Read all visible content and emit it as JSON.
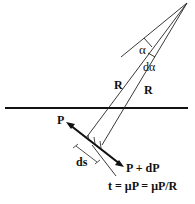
{
  "diagram": {
    "labels": {
      "alpha": "α",
      "d_alpha": "dα",
      "radius_left": "R",
      "radius_right": "R",
      "tension_in": "P",
      "tension_out": "P + dP",
      "arc_length": "ds",
      "equation": "t = μP = μP/R"
    },
    "colors": {
      "line": "#111111",
      "background": "#ffffff"
    }
  }
}
